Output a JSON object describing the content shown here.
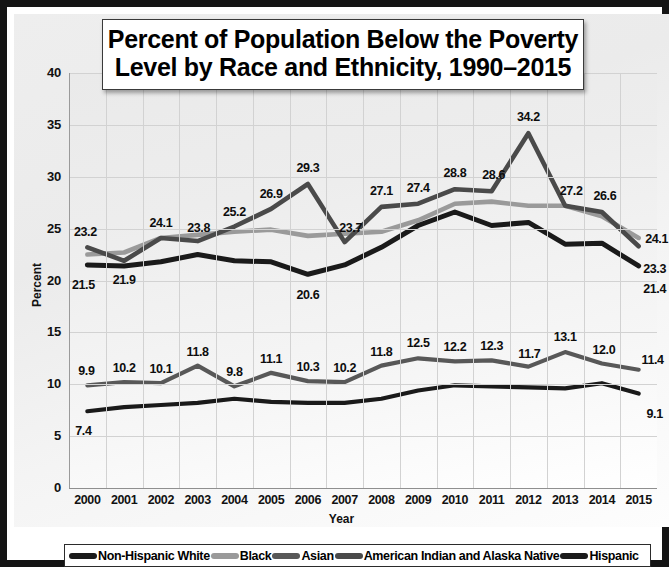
{
  "title": "Percent of Population Below the Poverty Level by Race and Ethnicity, 1990–2015",
  "title_line1": "Percent of Population Below the Poverty",
  "title_line2": "Level by Race and Ethnicity, 1990–2015",
  "axes": {
    "xlabel": "Year",
    "ylabel": "Percent",
    "yticks": [
      "0",
      "5",
      "10",
      "15",
      "20",
      "25",
      "30",
      "35",
      "40"
    ],
    "xticks": [
      "2000",
      "2001",
      "2002",
      "2003",
      "2004",
      "2005",
      "2006",
      "2007",
      "2008",
      "2009",
      "2010",
      "2011",
      "2012",
      "2013",
      "2014",
      "2015"
    ]
  },
  "legend": {
    "entries": [
      {
        "label": "Non-Hispanic White",
        "color": "#1a1a1a"
      },
      {
        "label": "Black",
        "color": "#9a9a9a"
      },
      {
        "label": "Asian",
        "color": "#585858"
      },
      {
        "label": "American Indian and Alaska Native",
        "color": "#4a4a4a"
      },
      {
        "label": "Hispanic",
        "color": "#1a1a1a"
      }
    ]
  },
  "chart_data": {
    "type": "line",
    "title": "Percent of Population Below the Poverty Level by Race and Ethnicity, 1990–2015",
    "xlabel": "Year",
    "ylabel": "Percent",
    "ylim": [
      0,
      40
    ],
    "ytick_step": 5,
    "grid": true,
    "legend_position": "bottom",
    "categories": [
      "2000",
      "2001",
      "2002",
      "2003",
      "2004",
      "2005",
      "2006",
      "2007",
      "2008",
      "2009",
      "2010",
      "2011",
      "2012",
      "2013",
      "2014",
      "2015"
    ],
    "series": [
      {
        "name": "Non-Hispanic White",
        "color": "#1a1a1a",
        "values": [
          7.4,
          7.8,
          8.0,
          8.2,
          8.6,
          8.3,
          8.2,
          8.2,
          8.6,
          9.4,
          9.9,
          9.8,
          9.7,
          9.6,
          10.1,
          9.1
        ],
        "labels": [
          {
            "index": 0,
            "text": "7.4"
          },
          {
            "index": 15,
            "text": "9.1"
          }
        ]
      },
      {
        "name": "Black",
        "color": "#9a9a9a",
        "values": [
          22.5,
          22.7,
          24.1,
          24.4,
          24.7,
          24.9,
          24.3,
          24.5,
          24.7,
          25.8,
          27.4,
          27.6,
          27.2,
          27.2,
          26.2,
          24.1
        ],
        "labels": [
          {
            "index": 15,
            "text": "24.1"
          }
        ]
      },
      {
        "name": "Asian",
        "color": "#585858",
        "values": [
          9.9,
          10.2,
          10.1,
          11.8,
          9.8,
          11.1,
          10.3,
          10.2,
          11.8,
          12.5,
          12.2,
          12.3,
          11.7,
          13.1,
          12.0,
          11.4
        ],
        "labels": [
          {
            "index": 0,
            "text": "9.9"
          },
          {
            "index": 1,
            "text": "10.2"
          },
          {
            "index": 2,
            "text": "10.1"
          },
          {
            "index": 3,
            "text": "11.8"
          },
          {
            "index": 4,
            "text": "9.8"
          },
          {
            "index": 5,
            "text": "11.1"
          },
          {
            "index": 6,
            "text": "10.3"
          },
          {
            "index": 7,
            "text": "10.2"
          },
          {
            "index": 8,
            "text": "11.8"
          },
          {
            "index": 9,
            "text": "12.5"
          },
          {
            "index": 10,
            "text": "12.2"
          },
          {
            "index": 11,
            "text": "12.3"
          },
          {
            "index": 12,
            "text": "11.7"
          },
          {
            "index": 13,
            "text": "13.1"
          },
          {
            "index": 14,
            "text": "12.0"
          },
          {
            "index": 15,
            "text": "11.4"
          }
        ]
      },
      {
        "name": "American Indian and Alaska Native",
        "color": "#4a4a4a",
        "values": [
          23.2,
          21.9,
          24.1,
          23.8,
          25.2,
          26.9,
          29.3,
          23.7,
          27.1,
          27.4,
          28.8,
          28.6,
          34.2,
          27.2,
          26.6,
          23.3
        ],
        "labels": [
          {
            "index": 0,
            "text": "23.2"
          },
          {
            "index": 1,
            "text": "21.9"
          },
          {
            "index": 2,
            "text": "24.1"
          },
          {
            "index": 3,
            "text": "23.8"
          },
          {
            "index": 4,
            "text": "25.2"
          },
          {
            "index": 5,
            "text": "26.9"
          },
          {
            "index": 6,
            "text": "29.3"
          },
          {
            "index": 7,
            "text": "23.7"
          },
          {
            "index": 8,
            "text": "27.1"
          },
          {
            "index": 9,
            "text": "27.4"
          },
          {
            "index": 10,
            "text": "28.8"
          },
          {
            "index": 11,
            "text": "28.6"
          },
          {
            "index": 12,
            "text": "34.2"
          },
          {
            "index": 13,
            "text": "27.2"
          },
          {
            "index": 14,
            "text": "26.6"
          },
          {
            "index": 15,
            "text": "23.3"
          }
        ]
      },
      {
        "name": "Hispanic",
        "color": "#1a1a1a",
        "values": [
          21.5,
          21.4,
          21.8,
          22.5,
          21.9,
          21.8,
          20.6,
          21.5,
          23.2,
          25.3,
          26.6,
          25.3,
          25.6,
          23.5,
          23.6,
          21.4
        ],
        "labels": [
          {
            "index": 0,
            "text": "21.5"
          },
          {
            "index": 6,
            "text": "20.6"
          },
          {
            "index": 15,
            "text": "21.4"
          }
        ]
      }
    ]
  }
}
